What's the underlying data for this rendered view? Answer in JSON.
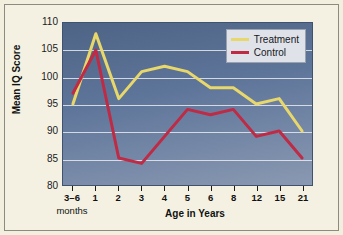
{
  "chart_data": {
    "type": "line",
    "title": "",
    "xlabel": "Age in Years",
    "xlabel_sub": "months",
    "ylabel": "Mean IQ Score",
    "categories": [
      "3–6",
      "1",
      "2",
      "3",
      "4",
      "5",
      "6",
      "8",
      "12",
      "15",
      "21"
    ],
    "ylim": [
      80,
      110
    ],
    "yticks": [
      80,
      85,
      90,
      95,
      100,
      105,
      110
    ],
    "ytick_labels": [
      "80",
      "85",
      "90",
      "95",
      "100",
      "105",
      "110"
    ],
    "grid": true,
    "legend_position": "top-right",
    "series": [
      {
        "name": "Treatment",
        "color": "#e8d76a",
        "values": [
          95,
          108,
          96,
          101,
          102,
          101,
          98,
          98,
          95,
          96,
          90
        ]
      },
      {
        "name": "Control",
        "color": "#bf2a45",
        "values": [
          97,
          105,
          85,
          84,
          89,
          94,
          93,
          94,
          89,
          90,
          85
        ]
      }
    ]
  },
  "legend": {
    "items": [
      {
        "label": "Treatment",
        "color": "#e8d76a"
      },
      {
        "label": "Control",
        "color": "#bf2a45"
      }
    ]
  },
  "colors": {
    "page_background": "#f4f1e2",
    "plot_background_top": "#4d6485",
    "plot_background_bottom": "#8a99b2",
    "gridline": "#e7eaf0",
    "treatment": "#e8d76a",
    "control": "#bf2a45",
    "axis_text": "#111111"
  }
}
